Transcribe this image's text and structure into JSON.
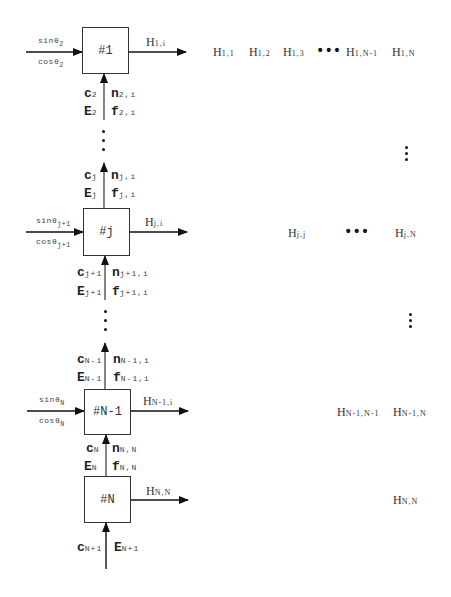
{
  "diagram": {
    "blocks": [
      {
        "id": "b1",
        "label": "#1"
      },
      {
        "id": "bj",
        "label": "#j"
      },
      {
        "id": "bn1",
        "label": "#N-1"
      },
      {
        "id": "bn",
        "label": "#N"
      }
    ],
    "inputs": {
      "b1": {
        "top_base": "sinθ",
        "top_sub": "2",
        "bot_base": "cosθ",
        "bot_sub": "2"
      },
      "bj": {
        "top_base": "sinθ",
        "top_sub": "j+1",
        "bot_base": "cosθ",
        "bot_sub": "j+1"
      },
      "bn1": {
        "top_base": "sinθ",
        "top_sub": "N",
        "bot_base": "cosθ",
        "bot_sub": "N"
      }
    },
    "outputs": {
      "b1": {
        "base": "H",
        "sub": "1,i"
      },
      "bj": {
        "base": "H",
        "sub": "j,i"
      },
      "bn1": {
        "base": "H",
        "sub": "N-1,i"
      },
      "bn": {
        "base": "H",
        "sub": "N,N"
      }
    },
    "links": {
      "into_b1": {
        "c": "c",
        "c_sub": "2",
        "e": "E",
        "e_sub": "2",
        "n": "n",
        "n_sub": "2,i",
        "f": "f",
        "f_sub": "2,i"
      },
      "into_dots_j": {
        "c": "c",
        "c_sub": "j",
        "e": "E",
        "e_sub": "j",
        "n": "n",
        "n_sub": "j,i",
        "f": "f",
        "f_sub": "j,i"
      },
      "into_bj": {
        "c": "c",
        "c_sub": "j+1",
        "e": "E",
        "e_sub": "j+1",
        "n": "n",
        "n_sub": "j+1,i",
        "f": "f",
        "f_sub": "j+1,i"
      },
      "into_bn1_top": {
        "c": "c",
        "c_sub": "N-1",
        "e": "E",
        "e_sub": "N-1",
        "n": "n",
        "n_sub": "N-1,i",
        "f": "f",
        "f_sub": "N-1,i"
      },
      "into_bn1": {
        "c": "c",
        "c_sub": "N",
        "e": "E",
        "e_sub": "N",
        "n": "n",
        "n_sub": "N,N",
        "f": "f",
        "f_sub": "N,N"
      },
      "into_bn": {
        "c": "c",
        "c_sub": "N+1",
        "e": "E",
        "e_sub": "N+1"
      }
    },
    "matrix": {
      "row1": [
        {
          "base": "H",
          "sub": "1,1"
        },
        {
          "base": "H",
          "sub": "1,2"
        },
        {
          "base": "H",
          "sub": "1,3"
        },
        {
          "ellipsis": "•••"
        },
        {
          "base": "H",
          "sub": "1,N-1"
        },
        {
          "base": "H",
          "sub": "1,N"
        }
      ],
      "rowj": [
        {
          "base": "H",
          "sub": "j,j"
        },
        {
          "ellipsis": "•••"
        },
        {
          "base": "H",
          "sub": "j,N"
        }
      ],
      "rowN1": [
        {
          "base": "H",
          "sub": "N-1,N-1"
        },
        {
          "base": "H",
          "sub": "N-1,N"
        }
      ],
      "rowN": [
        {
          "base": "H",
          "sub": "N,N"
        }
      ]
    }
  }
}
